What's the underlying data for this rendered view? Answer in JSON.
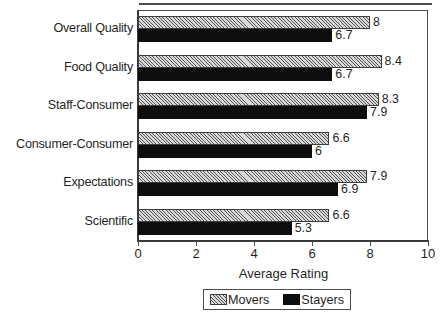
{
  "chart_data": {
    "type": "bar",
    "orientation": "horizontal",
    "title": "",
    "xlabel": "Average Rating",
    "ylabel": "",
    "xlim": [
      0,
      10
    ],
    "xticks": [
      0,
      2,
      4,
      6,
      8,
      10
    ],
    "xtick_labels": [
      "0",
      "2",
      "4",
      "6",
      "8",
      "10"
    ],
    "grid": false,
    "legend_position": "bottom-center",
    "categories": [
      "Overall Quality",
      "Food Quality",
      "Staff-Consumer",
      "Consumer-Consumer",
      "Expectations",
      "Scientific"
    ],
    "series": [
      {
        "name": "Movers",
        "fill": "hatched",
        "values": [
          8,
          8.4,
          8.3,
          6.6,
          7.9,
          6.6
        ],
        "value_labels": [
          "8",
          "8.4",
          "8.3",
          "6.6",
          "7.9",
          "6.6"
        ]
      },
      {
        "name": "Stayers",
        "fill": "solid-black",
        "values": [
          6.7,
          6.7,
          7.9,
          6,
          6.9,
          5.3
        ],
        "value_labels": [
          "6.7",
          "6.7",
          "7.9",
          "6",
          "6.9",
          "5.3"
        ]
      }
    ]
  },
  "colors": {
    "movers_fill": "#d9d9d9",
    "stayers_fill": "#0d0d0d",
    "axis": "#4d4d4d",
    "text": "#1f1f1f",
    "background": "#ffffff"
  }
}
